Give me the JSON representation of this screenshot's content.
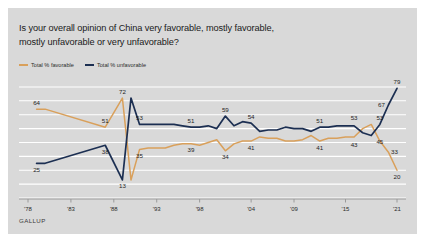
{
  "figure": {
    "background_color": "#d9d9d9",
    "page_background": "#ffffff"
  },
  "title": {
    "line1": "Is your overall opinion of China very favorable, mostly favorable,",
    "line2": "mostly unfavorable or very unfavorable?"
  },
  "legend": {
    "position": "top-left",
    "items": [
      {
        "label": "Total % favorable",
        "color": "#d9a05b"
      },
      {
        "label": "Total % unfavorable",
        "color": "#1c2f52"
      }
    ]
  },
  "source": {
    "brand": "GALLUP"
  },
  "chart_data": {
    "type": "line",
    "title": "Is your overall opinion of China very favorable, mostly favorable, mostly unfavorable or very unfavorable?",
    "xlabel": "",
    "ylabel": "",
    "xlim": [
      1978,
      2021
    ],
    "ylim": [
      0,
      85
    ],
    "grid": true,
    "grid_orientation": "horizontal",
    "grid_color": "#ffffff",
    "tick_labels": [
      "'78",
      "'83",
      "'88",
      "'93",
      "'98",
      "'04",
      "'09",
      "'15",
      "'21"
    ],
    "tick_years": [
      1978,
      1983,
      1988,
      1993,
      1998,
      2004,
      2009,
      2015,
      2021
    ],
    "series": [
      {
        "name": "Total % favorable",
        "color": "#d9a05b",
        "x": [
          1979,
          1980,
          1987,
          1989,
          1990,
          1991,
          1992,
          1993,
          1994,
          1995,
          1996,
          1997,
          1998,
          1999,
          2000,
          2001,
          2002,
          2003,
          2004,
          2005,
          2006,
          2007,
          2008,
          2009,
          2010,
          2011,
          2012,
          2013,
          2014,
          2015,
          2016,
          2017,
          2018,
          2019,
          2020,
          2021
        ],
        "y": [
          64,
          64,
          51,
          72,
          13,
          35,
          36,
          36,
          36,
          38,
          39,
          39,
          38,
          40,
          42,
          34,
          39,
          41,
          41,
          44,
          43,
          43,
          41,
          41,
          42,
          45,
          41,
          43,
          43,
          44,
          44,
          50,
          53,
          41,
          33,
          20
        ],
        "labels": [
          {
            "x": 1979,
            "y": 64,
            "text": "64",
            "pos": "above"
          },
          {
            "x": 1987,
            "y": 51,
            "text": "51",
            "pos": "above"
          },
          {
            "x": 1989,
            "y": 72,
            "text": "72",
            "pos": "above"
          },
          {
            "x": 1991,
            "y": 35,
            "text": "35",
            "pos": "below"
          },
          {
            "x": 1997,
            "y": 39,
            "text": "39",
            "pos": "below"
          },
          {
            "x": 2001,
            "y": 34,
            "text": "34",
            "pos": "below"
          },
          {
            "x": 2004,
            "y": 41,
            "text": "41",
            "pos": "below"
          },
          {
            "x": 2012,
            "y": 41,
            "text": "41",
            "pos": "below"
          },
          {
            "x": 2016,
            "y": 43,
            "text": "43",
            "pos": "below"
          },
          {
            "x": 2019,
            "y": 45,
            "text": "45",
            "pos": "below"
          },
          {
            "x": 2020,
            "y": 33,
            "text": "33",
            "pos": "right"
          },
          {
            "x": 2021,
            "y": 20,
            "text": "20",
            "pos": "below"
          }
        ]
      },
      {
        "name": "Total % unfavorable",
        "color": "#1c2f52",
        "x": [
          1979,
          1980,
          1987,
          1989,
          1990,
          1991,
          1992,
          1993,
          1994,
          1995,
          1996,
          1997,
          1998,
          1999,
          2000,
          2001,
          2002,
          2003,
          2004,
          2005,
          2006,
          2007,
          2008,
          2009,
          2010,
          2011,
          2012,
          2013,
          2014,
          2015,
          2016,
          2017,
          2018,
          2019,
          2020,
          2021
        ],
        "y": [
          25,
          25,
          38,
          13,
          72,
          53,
          53,
          53,
          53,
          53,
          52,
          51,
          51,
          52,
          50,
          59,
          52,
          55,
          54,
          48,
          49,
          49,
          51,
          50,
          50,
          48,
          51,
          51,
          52,
          52,
          52,
          47,
          45,
          53,
          67,
          79
        ],
        "labels": [
          {
            "x": 1979,
            "y": 25,
            "text": "25",
            "pos": "below"
          },
          {
            "x": 1987,
            "y": 38,
            "text": "38",
            "pos": "below"
          },
          {
            "x": 1989,
            "y": 13,
            "text": "13",
            "pos": "below"
          },
          {
            "x": 1991,
            "y": 53,
            "text": "53",
            "pos": "above"
          },
          {
            "x": 1997,
            "y": 51,
            "text": "51",
            "pos": "above"
          },
          {
            "x": 2001,
            "y": 59,
            "text": "59",
            "pos": "above"
          },
          {
            "x": 2004,
            "y": 54,
            "text": "54",
            "pos": "above"
          },
          {
            "x": 2012,
            "y": 51,
            "text": "51",
            "pos": "above"
          },
          {
            "x": 2016,
            "y": 53,
            "text": "53",
            "pos": "above"
          },
          {
            "x": 2019,
            "y": 53,
            "text": "53",
            "pos": "above"
          },
          {
            "x": 2020,
            "y": 67,
            "text": "67",
            "pos": "left"
          },
          {
            "x": 2021,
            "y": 79,
            "text": "79",
            "pos": "above"
          }
        ]
      }
    ]
  }
}
